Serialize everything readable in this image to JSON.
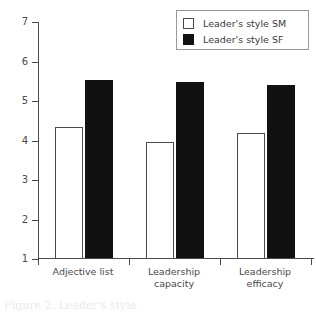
{
  "chart_data": {
    "type": "bar",
    "title": "",
    "xlabel": "",
    "ylabel": "",
    "ylim": [
      1,
      7
    ],
    "yticks": [
      1,
      2,
      3,
      4,
      5,
      6,
      7
    ],
    "grid": false,
    "legend_position": "top-right",
    "categories": [
      "Adjective list",
      "Leadership capacity",
      "Leadership efficacy"
    ],
    "category_lines": [
      [
        "Adjective list"
      ],
      [
        "Leadership",
        "capacity"
      ],
      [
        "Leadership",
        "efficacy"
      ]
    ],
    "series": [
      {
        "name": "Leader's style SM",
        "color": "#ffffff",
        "edge_color": "#4a4a4a",
        "values": [
          4.35,
          3.95,
          4.2
        ]
      },
      {
        "name": "Leader's style SF",
        "color": "#111111",
        "edge_color": "#111111",
        "values": [
          5.53,
          5.47,
          5.4
        ]
      }
    ]
  },
  "legend": {
    "items": [
      {
        "label": "Leader's style SM",
        "swatch": "open-square-swatch"
      },
      {
        "label": "Leader's style SF",
        "swatch": "filled-square-swatch"
      }
    ]
  },
  "axes": {
    "y_tick_labels": [
      "7",
      "6",
      "5",
      "4",
      "3",
      "2",
      "1"
    ]
  },
  "caption": {
    "text": "Figure 2. Leader's style"
  }
}
